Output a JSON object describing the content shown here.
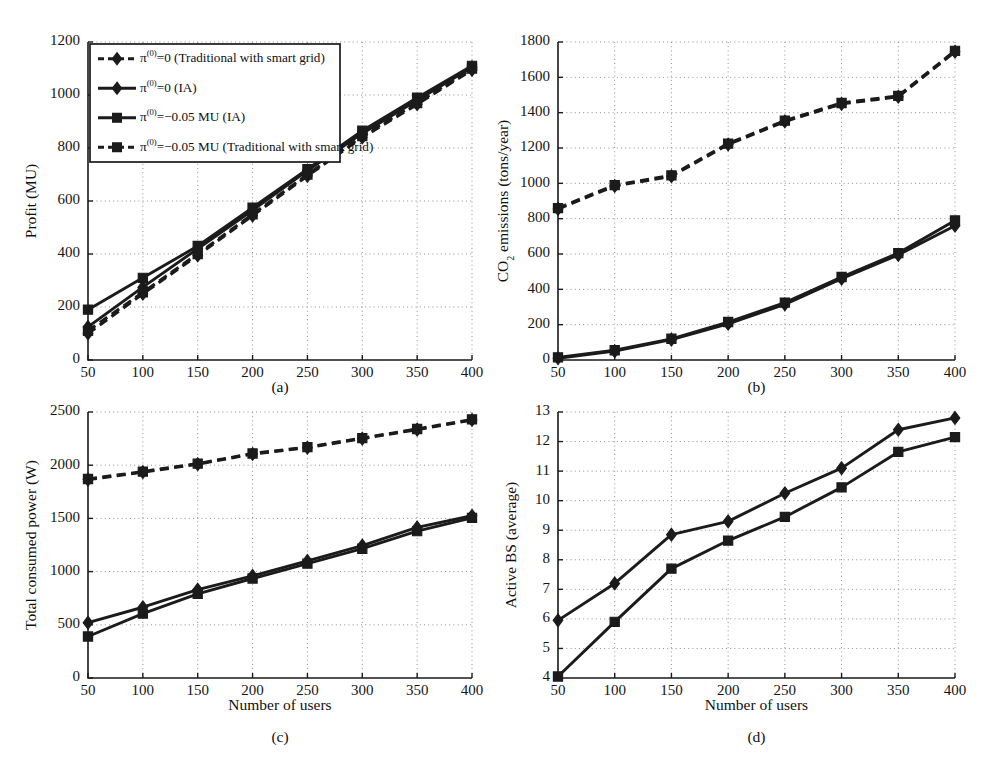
{
  "figure": {
    "panel_captions": [
      "(a)",
      "(b)",
      "(c)",
      "(d)"
    ],
    "xlabel": "Number of users",
    "legend": {
      "items": [
        {
          "id": "trad-pi0",
          "label_prefix": "π",
          "label_sup": "(0)",
          "label_rest": "=0 (Traditional with smart grid)",
          "marker": "diamond",
          "style": "dashed"
        },
        {
          "id": "ia-pi0",
          "label_prefix": "π",
          "label_sup": "(0)",
          "label_rest": "=0 (IA)",
          "marker": "diamond",
          "style": "solid"
        },
        {
          "id": "ia-pi005",
          "label_prefix": "π",
          "label_sup": "(0)",
          "label_rest": "=−0.05 MU (IA)",
          "marker": "square",
          "style": "solid"
        },
        {
          "id": "trad-pi005",
          "label_prefix": "π",
          "label_sup": "(0)",
          "label_rest": "=−0.05 MU (Traditional with smart grid)",
          "marker": "square",
          "style": "dashed"
        }
      ]
    },
    "colors": {
      "ink": "#1b1b1b",
      "grid": "#8f8f8f",
      "background": "#ffffff"
    }
  },
  "chart_data": [
    {
      "id": "panel-a",
      "type": "line",
      "caption": "(a)",
      "title": "",
      "xlabel": "",
      "ylabel": "Profit (MU)",
      "x": [
        50,
        100,
        150,
        200,
        250,
        300,
        350,
        400
      ],
      "xticks": [
        50,
        100,
        150,
        200,
        250,
        300,
        350,
        400
      ],
      "yticks": [
        0,
        200,
        400,
        600,
        800,
        1000,
        1200
      ],
      "xlim": [
        50,
        400
      ],
      "ylim": [
        0,
        1200
      ],
      "grid": true,
      "legend_position": "upper-left-inside",
      "series": [
        {
          "name": "π(0)=0 (Traditional with smart grid)",
          "marker": "diamond",
          "style": "dashed",
          "values": [
            100,
            250,
            395,
            545,
            695,
            840,
            965,
            1095
          ]
        },
        {
          "name": "π(0)=0 (IA)",
          "marker": "diamond",
          "style": "solid",
          "values": [
            125,
            275,
            420,
            565,
            715,
            855,
            980,
            1105
          ]
        },
        {
          "name": "π(0)=−0.05 MU (IA)",
          "marker": "square",
          "style": "solid",
          "values": [
            190,
            310,
            430,
            575,
            720,
            865,
            990,
            1110
          ]
        },
        {
          "name": "π(0)=−0.05 MU (Traditional with smart grid)",
          "marker": "square",
          "style": "dashed",
          "values": [
            110,
            255,
            400,
            550,
            700,
            845,
            970,
            1100
          ]
        }
      ]
    },
    {
      "id": "panel-b",
      "type": "line",
      "caption": "(b)",
      "title": "",
      "xlabel": "",
      "ylabel": "CO₂ emissions (tons/year)",
      "x": [
        50,
        100,
        150,
        200,
        250,
        300,
        350,
        400
      ],
      "xticks": [
        50,
        100,
        150,
        200,
        250,
        300,
        350,
        400
      ],
      "yticks": [
        0,
        200,
        400,
        600,
        800,
        1000,
        1200,
        1400,
        1600,
        1800
      ],
      "xlim": [
        50,
        400
      ],
      "ylim": [
        0,
        1800
      ],
      "grid": true,
      "legend_position": "none",
      "series": [
        {
          "name": "π(0)=0 (Traditional with smart grid)",
          "marker": "diamond",
          "style": "dashed",
          "values": [
            855,
            985,
            1040,
            1220,
            1350,
            1450,
            1490,
            1745
          ]
        },
        {
          "name": "π(0)=−0.05 MU (Traditional with smart grid)",
          "marker": "square",
          "style": "dashed",
          "values": [
            860,
            990,
            1045,
            1225,
            1355,
            1455,
            1495,
            1750
          ]
        },
        {
          "name": "π(0)=0 (IA)",
          "marker": "diamond",
          "style": "solid",
          "values": [
            10,
            50,
            115,
            205,
            315,
            460,
            595,
            760
          ]
        },
        {
          "name": "π(0)=−0.05 MU (IA)",
          "marker": "square",
          "style": "solid",
          "values": [
            15,
            55,
            120,
            215,
            325,
            470,
            605,
            790
          ]
        }
      ]
    },
    {
      "id": "panel-c",
      "type": "line",
      "caption": "(c)",
      "title": "",
      "xlabel": "Number of users",
      "ylabel": "Total consumed power (W)",
      "x": [
        50,
        100,
        150,
        200,
        250,
        300,
        350,
        400
      ],
      "xticks": [
        50,
        100,
        150,
        200,
        250,
        300,
        350,
        400
      ],
      "yticks": [
        0,
        500,
        1000,
        1500,
        2000,
        2500
      ],
      "xlim": [
        50,
        400
      ],
      "ylim": [
        0,
        2500
      ],
      "grid": true,
      "legend_position": "none",
      "series": [
        {
          "name": "π(0)=0 (Traditional with smart grid)",
          "marker": "diamond",
          "style": "dashed",
          "values": [
            1865,
            1935,
            2010,
            2105,
            2165,
            2250,
            2335,
            2425
          ]
        },
        {
          "name": "π(0)=−0.05 MU (Traditional with smart grid)",
          "marker": "square",
          "style": "dashed",
          "values": [
            1870,
            1940,
            2015,
            2110,
            2170,
            2255,
            2340,
            2430
          ]
        },
        {
          "name": "π(0)=0 (IA)",
          "marker": "diamond",
          "style": "solid",
          "values": [
            520,
            665,
            830,
            960,
            1100,
            1245,
            1415,
            1525
          ]
        },
        {
          "name": "π(0)=−0.05 MU (IA)",
          "marker": "square",
          "style": "solid",
          "values": [
            390,
            605,
            790,
            935,
            1075,
            1215,
            1380,
            1505
          ]
        }
      ]
    },
    {
      "id": "panel-d",
      "type": "line",
      "caption": "(d)",
      "title": "",
      "xlabel": "Number of users",
      "ylabel": "Active BS (average)",
      "x": [
        50,
        100,
        150,
        200,
        250,
        300,
        350,
        400
      ],
      "xticks": [
        50,
        100,
        150,
        200,
        250,
        300,
        350,
        400
      ],
      "yticks": [
        4,
        5,
        6,
        7,
        8,
        9,
        10,
        11,
        12,
        13
      ],
      "xlim": [
        50,
        400
      ],
      "ylim": [
        4,
        13
      ],
      "grid": true,
      "legend_position": "none",
      "series": [
        {
          "name": "π(0)=0 (IA)",
          "marker": "diamond",
          "style": "solid",
          "values": [
            5.95,
            7.2,
            8.85,
            9.3,
            10.25,
            11.1,
            12.4,
            12.8
          ]
        },
        {
          "name": "π(0)=−0.05 MU (IA)",
          "marker": "square",
          "style": "solid",
          "values": [
            4.05,
            5.9,
            7.7,
            8.65,
            9.45,
            10.45,
            11.65,
            12.15
          ]
        }
      ]
    }
  ]
}
